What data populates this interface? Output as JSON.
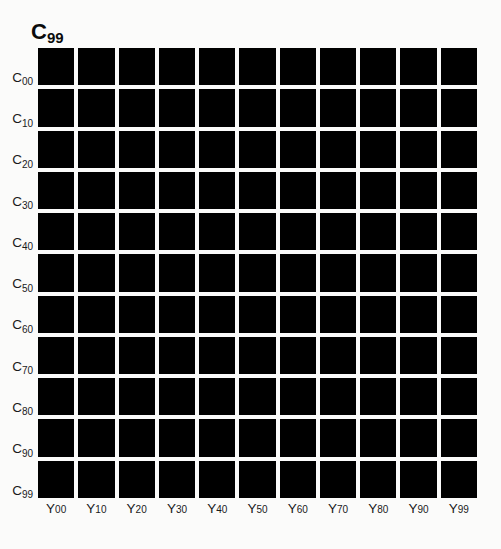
{
  "figure": {
    "title_base": "B",
    "title_sub": "99",
    "background_color": "#fbfbfa",
    "patch_color": "#000000",
    "label_color": "#1a1a1a"
  },
  "chart_data": {
    "type": "heatmap",
    "xlabel": "",
    "ylabel": "",
    "grid": false,
    "legend": "none",
    "colormap": "all-black",
    "categories": [
      "Y00",
      "Y10",
      "Y20",
      "Y30",
      "Y40",
      "Y50",
      "Y60",
      "Y70",
      "Y80",
      "Y90",
      "Y99"
    ],
    "row_categories": [
      "C00",
      "C10",
      "C20",
      "C30",
      "C40",
      "C50",
      "C60",
      "C70",
      "C80",
      "C90",
      "C99"
    ],
    "x_tick_bases": [
      "Y",
      "Y",
      "Y",
      "Y",
      "Y",
      "Y",
      "Y",
      "Y",
      "Y",
      "Y",
      "Y"
    ],
    "x_tick_subs": [
      "00",
      "10",
      "20",
      "30",
      "40",
      "50",
      "60",
      "70",
      "80",
      "90",
      "99"
    ],
    "y_tick_bases": [
      "C",
      "C",
      "C",
      "C",
      "C",
      "C",
      "C",
      "C",
      "C",
      "C",
      "C"
    ],
    "y_tick_subs": [
      "00",
      "10",
      "20",
      "30",
      "40",
      "50",
      "60",
      "70",
      "80",
      "90",
      "99"
    ],
    "rows": 11,
    "cols": 11,
    "values": [
      [
        0,
        0,
        0,
        0,
        0,
        0,
        0,
        0,
        0,
        0,
        0
      ],
      [
        0,
        0,
        0,
        0,
        0,
        0,
        0,
        0,
        0,
        0,
        0
      ],
      [
        0,
        0,
        0,
        0,
        0,
        0,
        0,
        0,
        0,
        0,
        0
      ],
      [
        0,
        0,
        0,
        0,
        0,
        0,
        0,
        0,
        0,
        0,
        0
      ],
      [
        0,
        0,
        0,
        0,
        0,
        0,
        0,
        0,
        0,
        0,
        0
      ],
      [
        0,
        0,
        0,
        0,
        0,
        0,
        0,
        0,
        0,
        0,
        0
      ],
      [
        0,
        0,
        0,
        0,
        0,
        0,
        0,
        0,
        0,
        0,
        0
      ],
      [
        0,
        0,
        0,
        0,
        0,
        0,
        0,
        0,
        0,
        0,
        0
      ],
      [
        0,
        0,
        0,
        0,
        0,
        0,
        0,
        0,
        0,
        0,
        0
      ],
      [
        0,
        0,
        0,
        0,
        0,
        0,
        0,
        0,
        0,
        0,
        0
      ],
      [
        0,
        0,
        0,
        0,
        0,
        0,
        0,
        0,
        0,
        0,
        0
      ]
    ],
    "cell_colors": [
      [
        "#000000",
        "#000000",
        "#000000",
        "#000000",
        "#000000",
        "#000000",
        "#000000",
        "#000000",
        "#000000",
        "#000000",
        "#000000"
      ],
      [
        "#000000",
        "#000000",
        "#000000",
        "#000000",
        "#000000",
        "#000000",
        "#000000",
        "#000000",
        "#000000",
        "#000000",
        "#000000"
      ],
      [
        "#000000",
        "#000000",
        "#000000",
        "#000000",
        "#000000",
        "#000000",
        "#000000",
        "#000000",
        "#000000",
        "#000000",
        "#000000"
      ],
      [
        "#000000",
        "#000000",
        "#000000",
        "#000000",
        "#000000",
        "#000000",
        "#000000",
        "#000000",
        "#000000",
        "#000000",
        "#000000"
      ],
      [
        "#000000",
        "#000000",
        "#000000",
        "#000000",
        "#000000",
        "#000000",
        "#000000",
        "#000000",
        "#000000",
        "#000000",
        "#000000"
      ],
      [
        "#000000",
        "#000000",
        "#000000",
        "#000000",
        "#000000",
        "#000000",
        "#000000",
        "#000000",
        "#000000",
        "#000000",
        "#000000"
      ],
      [
        "#000000",
        "#000000",
        "#000000",
        "#000000",
        "#000000",
        "#000000",
        "#000000",
        "#000000",
        "#000000",
        "#000000",
        "#000000"
      ],
      [
        "#000000",
        "#000000",
        "#000000",
        "#000000",
        "#000000",
        "#000000",
        "#000000",
        "#000000",
        "#000000",
        "#000000",
        "#000000"
      ],
      [
        "#000000",
        "#000000",
        "#000000",
        "#000000",
        "#000000",
        "#000000",
        "#000000",
        "#000000",
        "#000000",
        "#000000",
        "#000000"
      ],
      [
        "#000000",
        "#000000",
        "#000000",
        "#000000",
        "#000000",
        "#000000",
        "#000000",
        "#000000",
        "#000000",
        "#000000",
        "#000000"
      ],
      [
        "#000000",
        "#000000",
        "#000000",
        "#000000",
        "#000000",
        "#000000",
        "#000000",
        "#000000",
        "#000000",
        "#000000",
        "#000000"
      ]
    ]
  }
}
